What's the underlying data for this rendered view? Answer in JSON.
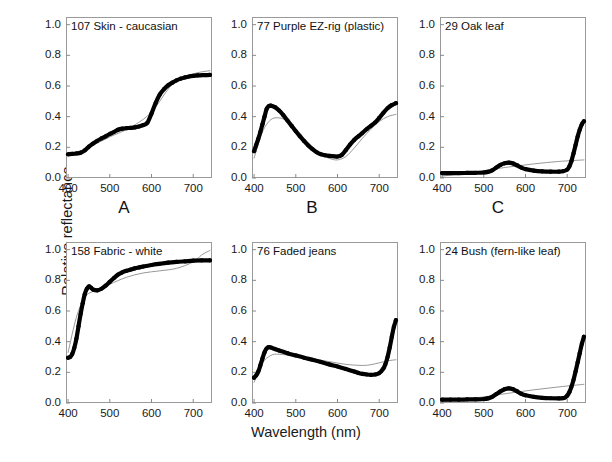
{
  "figure": {
    "xlabel": "Wavelength (nm)",
    "ylabel": "Relative reflectance",
    "background_color": "#ffffff",
    "data_color": "#000000",
    "fit_color": "#8c8c8c",
    "frame_color": "#9a9a9a"
  },
  "axes": {
    "xticks": [
      "400",
      "500",
      "600",
      "700"
    ],
    "xtick_values": [
      400,
      500,
      600,
      700
    ],
    "yticks": [
      "0.0",
      "0.2",
      "0.4",
      "0.6",
      "0.8",
      "1.0"
    ],
    "ytick_values": [
      0.0,
      0.2,
      0.4,
      0.6,
      0.8,
      1.0
    ],
    "xlim": [
      395,
      745
    ],
    "ylim": [
      0.0,
      1.05
    ]
  },
  "panel_letters": {
    "a": "A",
    "b": "B",
    "c": "C"
  },
  "chart_data": [
    {
      "type": "line",
      "title": "107 Skin - caucasian",
      "panel_letter": "A",
      "xlabel": "Wavelength (nm)",
      "ylabel": "Relative reflectance",
      "xlim": [
        395,
        745
      ],
      "ylim": [
        0.0,
        1.05
      ],
      "grid": false,
      "legend": "none",
      "series": [
        {
          "name": "measured reflectance",
          "style": "thick-black",
          "x": [
            400,
            410,
            420,
            430,
            440,
            450,
            460,
            470,
            480,
            490,
            500,
            510,
            520,
            530,
            540,
            550,
            560,
            570,
            580,
            590,
            600,
            610,
            620,
            630,
            640,
            650,
            660,
            670,
            680,
            690,
            700,
            710,
            720,
            730,
            740
          ],
          "y": [
            0.155,
            0.157,
            0.16,
            0.165,
            0.18,
            0.205,
            0.225,
            0.243,
            0.258,
            0.272,
            0.287,
            0.3,
            0.315,
            0.322,
            0.325,
            0.327,
            0.33,
            0.336,
            0.345,
            0.36,
            0.42,
            0.49,
            0.545,
            0.58,
            0.605,
            0.622,
            0.637,
            0.648,
            0.656,
            0.662,
            0.666,
            0.669,
            0.67,
            0.671,
            0.672
          ]
        },
        {
          "name": "linear model fit",
          "style": "thin-gray",
          "x": [
            400,
            450,
            500,
            550,
            600,
            650,
            700,
            740
          ],
          "y": [
            0.14,
            0.2,
            0.268,
            0.33,
            0.43,
            0.61,
            0.678,
            0.7
          ]
        }
      ]
    },
    {
      "type": "line",
      "title": "77 Purple EZ-rig (plastic)",
      "panel_letter": "B",
      "xlabel": "Wavelength (nm)",
      "ylabel": "Relative reflectance",
      "xlim": [
        395,
        745
      ],
      "ylim": [
        0.0,
        1.05
      ],
      "grid": false,
      "legend": "none",
      "series": [
        {
          "name": "measured reflectance",
          "style": "thick-black",
          "x": [
            400,
            405,
            410,
            415,
            420,
            425,
            430,
            435,
            440,
            450,
            460,
            470,
            480,
            490,
            500,
            510,
            520,
            530,
            540,
            550,
            560,
            570,
            580,
            590,
            600,
            610,
            620,
            630,
            640,
            650,
            660,
            670,
            680,
            690,
            700,
            710,
            720,
            730,
            740
          ],
          "y": [
            0.175,
            0.215,
            0.255,
            0.3,
            0.35,
            0.4,
            0.45,
            0.468,
            0.472,
            0.462,
            0.44,
            0.41,
            0.375,
            0.34,
            0.305,
            0.272,
            0.24,
            0.212,
            0.188,
            0.168,
            0.155,
            0.148,
            0.144,
            0.142,
            0.14,
            0.15,
            0.182,
            0.218,
            0.248,
            0.272,
            0.295,
            0.318,
            0.34,
            0.362,
            0.392,
            0.425,
            0.455,
            0.475,
            0.488
          ]
        },
        {
          "name": "linear model fit",
          "style": "thin-gray",
          "x": [
            400,
            420,
            440,
            460,
            480,
            500,
            520,
            540,
            560,
            580,
            600,
            620,
            640,
            660,
            680,
            700,
            720,
            740
          ],
          "y": [
            0.13,
            0.3,
            0.38,
            0.392,
            0.37,
            0.32,
            0.26,
            0.2,
            0.155,
            0.128,
            0.118,
            0.14,
            0.195,
            0.26,
            0.318,
            0.368,
            0.4,
            0.415
          ]
        }
      ]
    },
    {
      "type": "line",
      "title": "29 Oak leaf",
      "panel_letter": "C",
      "xlabel": "Wavelength (nm)",
      "ylabel": "Relative reflectance",
      "xlim": [
        395,
        745
      ],
      "ylim": [
        0.0,
        1.05
      ],
      "grid": false,
      "legend": "none",
      "series": [
        {
          "name": "measured reflectance",
          "style": "thick-black",
          "x": [
            400,
            420,
            440,
            460,
            480,
            500,
            510,
            520,
            530,
            540,
            550,
            560,
            570,
            580,
            590,
            600,
            620,
            640,
            660,
            680,
            690,
            700,
            705,
            710,
            715,
            720,
            725,
            730,
            735,
            740
          ],
          "y": [
            0.032,
            0.032,
            0.032,
            0.033,
            0.034,
            0.036,
            0.04,
            0.05,
            0.068,
            0.085,
            0.096,
            0.1,
            0.095,
            0.082,
            0.068,
            0.058,
            0.048,
            0.043,
            0.041,
            0.041,
            0.044,
            0.055,
            0.075,
            0.11,
            0.16,
            0.215,
            0.27,
            0.315,
            0.35,
            0.37
          ]
        },
        {
          "name": "linear model fit",
          "style": "thin-gray",
          "x": [
            400,
            500,
            560,
            620,
            680,
            740
          ],
          "y": [
            0.012,
            0.048,
            0.072,
            0.092,
            0.108,
            0.118
          ]
        }
      ]
    },
    {
      "type": "line",
      "title": "158 Fabric - white",
      "panel_letter": "",
      "xlabel": "Wavelength (nm)",
      "ylabel": "Relative reflectance",
      "xlim": [
        395,
        745
      ],
      "ylim": [
        0.0,
        1.05
      ],
      "grid": false,
      "legend": "none",
      "series": [
        {
          "name": "measured reflectance",
          "style": "thick-black",
          "x": [
            400,
            405,
            410,
            415,
            420,
            425,
            430,
            435,
            440,
            445,
            450,
            455,
            460,
            470,
            480,
            490,
            500,
            510,
            520,
            530,
            540,
            550,
            560,
            570,
            580,
            600,
            620,
            640,
            660,
            680,
            700,
            720,
            740
          ],
          "y": [
            0.295,
            0.3,
            0.32,
            0.36,
            0.42,
            0.5,
            0.58,
            0.65,
            0.71,
            0.745,
            0.76,
            0.752,
            0.74,
            0.735,
            0.745,
            0.765,
            0.79,
            0.815,
            0.838,
            0.852,
            0.862,
            0.87,
            0.878,
            0.884,
            0.89,
            0.9,
            0.908,
            0.915,
            0.92,
            0.924,
            0.928,
            0.93,
            0.93
          ]
        },
        {
          "name": "linear model fit",
          "style": "thin-gray",
          "x": [
            400,
            420,
            440,
            460,
            480,
            500,
            540,
            580,
            620,
            660,
            700,
            720,
            740
          ],
          "y": [
            0.33,
            0.56,
            0.69,
            0.728,
            0.75,
            0.775,
            0.82,
            0.848,
            0.862,
            0.878,
            0.92,
            0.965,
            0.995
          ]
        }
      ]
    },
    {
      "type": "line",
      "title": "76 Faded jeans",
      "panel_letter": "",
      "xlabel": "Wavelength (nm)",
      "ylabel": "Relative reflectance",
      "xlim": [
        395,
        745
      ],
      "ylim": [
        0.0,
        1.05
      ],
      "grid": false,
      "legend": "none",
      "series": [
        {
          "name": "measured reflectance",
          "style": "thick-black",
          "x": [
            400,
            405,
            410,
            415,
            420,
            425,
            430,
            435,
            440,
            450,
            460,
            480,
            500,
            520,
            540,
            560,
            580,
            600,
            620,
            640,
            650,
            660,
            670,
            680,
            690,
            700,
            710,
            715,
            720,
            725,
            730,
            735,
            740
          ],
          "y": [
            0.165,
            0.18,
            0.205,
            0.245,
            0.29,
            0.33,
            0.355,
            0.365,
            0.362,
            0.352,
            0.342,
            0.325,
            0.31,
            0.295,
            0.282,
            0.268,
            0.252,
            0.238,
            0.222,
            0.205,
            0.196,
            0.19,
            0.186,
            0.184,
            0.186,
            0.195,
            0.225,
            0.255,
            0.3,
            0.36,
            0.43,
            0.495,
            0.54
          ]
        },
        {
          "name": "linear model fit",
          "style": "thin-gray",
          "x": [
            400,
            420,
            440,
            460,
            500,
            540,
            580,
            620,
            660,
            680,
            700,
            720,
            740
          ],
          "y": [
            0.135,
            0.26,
            0.31,
            0.318,
            0.305,
            0.288,
            0.27,
            0.252,
            0.245,
            0.25,
            0.262,
            0.275,
            0.282
          ]
        }
      ]
    },
    {
      "type": "line",
      "title": "24 Bush (fern-like leaf)",
      "panel_letter": "",
      "xlabel": "Wavelength (nm)",
      "ylabel": "Relative reflectance",
      "xlim": [
        395,
        745
      ],
      "ylim": [
        0.0,
        1.05
      ],
      "grid": false,
      "legend": "none",
      "series": [
        {
          "name": "measured reflectance",
          "style": "thick-black",
          "x": [
            400,
            420,
            440,
            460,
            480,
            500,
            510,
            520,
            530,
            540,
            550,
            560,
            570,
            580,
            590,
            600,
            620,
            640,
            660,
            680,
            690,
            695,
            700,
            705,
            710,
            715,
            720,
            725,
            730,
            735,
            740
          ],
          "y": [
            0.022,
            0.022,
            0.022,
            0.023,
            0.024,
            0.026,
            0.03,
            0.04,
            0.058,
            0.076,
            0.09,
            0.095,
            0.09,
            0.076,
            0.06,
            0.05,
            0.04,
            0.034,
            0.031,
            0.03,
            0.032,
            0.036,
            0.048,
            0.07,
            0.105,
            0.15,
            0.205,
            0.265,
            0.325,
            0.385,
            0.432
          ]
        },
        {
          "name": "linear model fit",
          "style": "thin-gray",
          "x": [
            400,
            500,
            560,
            620,
            680,
            740
          ],
          "y": [
            0.008,
            0.04,
            0.064,
            0.086,
            0.105,
            0.122
          ]
        }
      ]
    }
  ]
}
